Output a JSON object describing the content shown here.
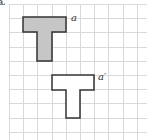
{
  "question_label": "a.",
  "grid": {
    "origin_x": 9,
    "origin_y": 4,
    "cell": 14.2,
    "cols": 10,
    "rows": 10,
    "line_color": "#d9d9d9"
  },
  "shapes": [
    {
      "name": "a",
      "label": "a",
      "fill": "#c6c6c6",
      "stroke": "#333333",
      "cells": "T-shape: top bar 3 cells wide, stem 1 cell wide x 2 cells tall",
      "points": [
        [
          23,
          17
        ],
        [
          66,
          17
        ],
        [
          66,
          32
        ],
        [
          52,
          32
        ],
        [
          52,
          61
        ],
        [
          37,
          61
        ],
        [
          37,
          32
        ],
        [
          23,
          32
        ]
      ]
    },
    {
      "name": "a-prime",
      "label": "a′",
      "fill": "#ffffff",
      "stroke": "#333333",
      "cells": "T-shape translated: 2 cells right, 4 cells down",
      "points": [
        [
          52,
          75
        ],
        [
          94,
          75
        ],
        [
          94,
          90
        ],
        [
          80,
          90
        ],
        [
          80,
          118
        ],
        [
          66,
          118
        ],
        [
          66,
          90
        ],
        [
          52,
          90
        ]
      ]
    }
  ],
  "translation": {
    "right_units": 2,
    "down_units": 4
  }
}
